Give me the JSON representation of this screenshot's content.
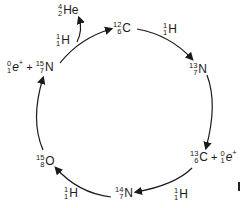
{
  "diagram": {
    "nodes": [
      {
        "id": "c12",
        "mass": "12",
        "atomic": "6",
        "symbol": "C"
      },
      {
        "id": "n13",
        "mass": "13",
        "atomic": "7",
        "symbol": "N"
      },
      {
        "id": "c13",
        "mass": "13",
        "atomic": "6",
        "symbol": "C",
        "extra": {
          "mass": "0",
          "atomic": "1",
          "symbol": "e",
          "charge": "+"
        }
      },
      {
        "id": "n14",
        "mass": "14",
        "atomic": "7",
        "symbol": "N"
      },
      {
        "id": "o15",
        "mass": "15",
        "atomic": "8",
        "symbol": "O"
      },
      {
        "id": "n15",
        "mass": "15",
        "atomic": "7",
        "symbol": "N",
        "prefix": {
          "mass": "0",
          "atomic": "1",
          "symbol": "e",
          "charge": "+"
        }
      }
    ],
    "inputs": [
      {
        "edge": "c12-n13",
        "mass": "1",
        "atomic": "1",
        "symbol": "H"
      },
      {
        "edge": "c13-n14",
        "mass": "1",
        "atomic": "1",
        "symbol": "H"
      },
      {
        "edge": "n14-o15",
        "mass": "1",
        "atomic": "1",
        "symbol": "H"
      },
      {
        "edge": "n15-c12",
        "mass": "1",
        "atomic": "1",
        "symbol": "H"
      }
    ],
    "outputs": [
      {
        "edge": "n15-c12",
        "mass": "4",
        "atomic": "2",
        "symbol": "He"
      }
    ],
    "plus": "+",
    "line_color": "#1a1a1a"
  }
}
